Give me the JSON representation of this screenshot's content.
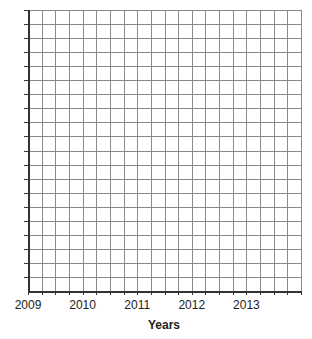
{
  "chart_data": {
    "type": "line",
    "title": "",
    "xlabel": "Years",
    "ylabel": "",
    "x_tick_labels": [
      "2009",
      "2010",
      "2011",
      "2012",
      "2013"
    ],
    "x_range": [
      2009,
      2014
    ],
    "x_minor_divisions_per_year": 4,
    "y_tick_labels": [],
    "grid": true,
    "grid_columns": 20,
    "grid_rows": 20,
    "series": [],
    "legend": null,
    "note": "Empty graph-paper grid; title clipped at top edge and unreadable"
  },
  "style": {
    "grid_color": "#8a8a8a",
    "axis_color": "#333333",
    "background": "#ffffff"
  }
}
